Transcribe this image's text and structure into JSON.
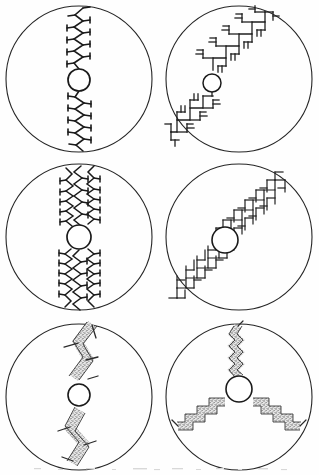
{
  "figure": {
    "title": "",
    "caption": "",
    "background_color": "#fefefe",
    "ink_color": "#1a1a1a",
    "stipple_color": "#5a5a5a",
    "stroke_width": 1.0,
    "panel_count": 6,
    "grid": {
      "columns": 2,
      "rows": 3
    },
    "panels": [
      {
        "id": "panel-1",
        "position": "top-left",
        "row": 1,
        "column": 1,
        "outer_circle": {
          "cx": 79,
          "cy": 79,
          "r": 73
        },
        "nucleus": {
          "cx": 79,
          "cy": 80,
          "r": 11,
          "label": "nucleus"
        },
        "morphology": "zigzag-dendrite",
        "symmetry": "2-fold",
        "axis_angle_deg": 90,
        "arms": 2,
        "branch_orders": 1,
        "side_branch_count": 13,
        "side_branch_length": 7,
        "zigzag_amplitude": 5,
        "zigzag_period": 11,
        "stroke_style": "thin-line",
        "texture": "none",
        "line_width": 1.6
      },
      {
        "id": "panel-2",
        "position": "top-right",
        "row": 1,
        "column": 2,
        "outer_circle": {
          "cx": 239,
          "cy": 79,
          "r": 73
        },
        "nucleus": {
          "cx": 213,
          "cy": 83,
          "r": 9,
          "label": "nucleus"
        },
        "morphology": "orthogonal-staircase-dendrite",
        "symmetry": "2-fold",
        "axis_angle_deg": 45,
        "arms": 2,
        "branch_orders": 3,
        "step_size": 13,
        "side_branch_count": 22,
        "side_branch_length": 9,
        "stroke_style": "thin-line",
        "texture": "none",
        "line_width": 1.3
      },
      {
        "id": "panel-3",
        "position": "middle-left",
        "row": 2,
        "column": 1,
        "outer_circle": {
          "cx": 79,
          "cy": 237,
          "r": 73
        },
        "nucleus": {
          "cx": 79,
          "cy": 237,
          "r": 12,
          "label": "nucleus"
        },
        "morphology": "multi-strand-zigzag-dendrite",
        "symmetry": "2-fold",
        "axis_angle_deg": 90,
        "arms": 2,
        "strands_per_arm": 3,
        "branch_orders": 2,
        "side_branch_count": 34,
        "side_branch_length": 6,
        "zigzag_amplitude": 5,
        "zigzag_period": 10,
        "stroke_style": "thin-line",
        "texture": "none",
        "line_width": 1.5
      },
      {
        "id": "panel-4",
        "position": "middle-right",
        "row": 2,
        "column": 2,
        "outer_circle": {
          "cx": 239,
          "cy": 237,
          "r": 73
        },
        "nucleus": {
          "cx": 226,
          "cy": 240,
          "r": 13,
          "label": "nucleus"
        },
        "morphology": "dense-orthogonal-dendrite",
        "symmetry": "2-fold",
        "axis_angle_deg": 45,
        "arms": 2,
        "branch_orders": 3,
        "step_size": 11,
        "side_branch_count": 40,
        "side_branch_length": 12,
        "stroke_style": "thin-line",
        "texture": "none",
        "line_width": 1.2
      },
      {
        "id": "panel-5",
        "position": "bottom-left",
        "row": 3,
        "column": 1,
        "outer_circle": {
          "cx": 79,
          "cy": 396,
          "r": 73
        },
        "nucleus": {
          "cx": 79,
          "cy": 383,
          "r": 11,
          "label": "nucleus"
        },
        "morphology": "thick-stippled-zigzag-band",
        "symmetry": "2-fold",
        "axis_angle_deg": 80,
        "arms": 2,
        "branch_orders": 1,
        "side_branch_count": 6,
        "side_branch_length": 17,
        "band_width": 9,
        "zigzag_amplitude": 11,
        "zigzag_period": 30,
        "stroke_style": "thick-band",
        "texture": "stipple",
        "line_width": 1.2
      },
      {
        "id": "panel-6",
        "position": "bottom-right",
        "row": 3,
        "column": 2,
        "outer_circle": {
          "cx": 239,
          "cy": 396,
          "r": 73
        },
        "nucleus": {
          "cx": 239,
          "cy": 387,
          "r": 13,
          "label": "nucleus"
        },
        "morphology": "three-armed-stippled-staircase",
        "symmetry": "3-fold",
        "axis_angle_deg": 90,
        "arms": 3,
        "arm_angles_deg": [
          270,
          30,
          150
        ],
        "branch_orders": 1,
        "step_size": 11,
        "band_width": 7,
        "stroke_style": "thick-band",
        "texture": "stipple",
        "line_width": 1.1
      }
    ]
  }
}
